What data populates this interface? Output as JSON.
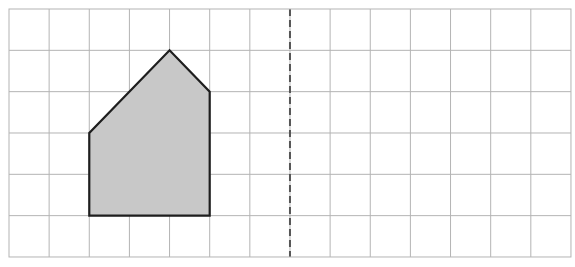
{
  "diagram": {
    "type": "grid-reflection",
    "grid": {
      "columns": 14,
      "rows": 6,
      "origin_px": [
        9,
        9
      ],
      "cell_width_px": 40.14,
      "cell_height_px": 41.33,
      "line_color": "#b4b4b4",
      "border_color": "#b4b4b4"
    },
    "mirror_line": {
      "orientation": "vertical",
      "grid_x": 7,
      "style": "dashed",
      "color": "#555555"
    },
    "shape": {
      "name": "pentagon",
      "fill": "#c8c8c8",
      "stroke": "#1e1e1e",
      "vertices_grid": [
        [
          2,
          5
        ],
        [
          2,
          3
        ],
        [
          4,
          1
        ],
        [
          5,
          2
        ],
        [
          5,
          5
        ]
      ]
    }
  }
}
